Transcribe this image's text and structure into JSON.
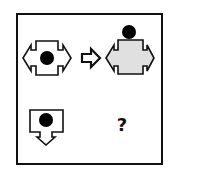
{
  "puzzle": {
    "type": "visual-analogy",
    "question_mark": "?",
    "colors": {
      "stroke": "#111111",
      "fill_white": "#ffffff",
      "fill_gray": "#e0e0e0",
      "dot": "#000000"
    },
    "cells": [
      {
        "position": "top-left",
        "description": "white box with black dot inside, double-headed horizontal arrows"
      },
      {
        "position": "arrow",
        "description": "right-pointing outlined arrow (transforms to)"
      },
      {
        "position": "top-right",
        "description": "gray box with black dot moved on top, double-headed horizontal arrows"
      },
      {
        "position": "bottom-left",
        "description": "white box with black dot inside, downward-pointing arrow"
      },
      {
        "position": "bottom-right",
        "description": "unknown answer"
      }
    ]
  }
}
